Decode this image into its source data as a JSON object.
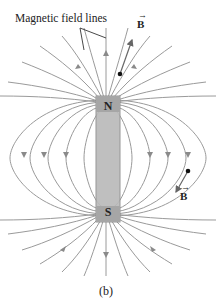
{
  "figure": {
    "label": "Magnetic field lines",
    "north_pole": "N",
    "south_pole": "S",
    "field_vector_top": "B",
    "field_vector_right": "B",
    "caption": "(b)"
  },
  "colors": {
    "field_line": "#9a9a9a",
    "magnet_fill": "#b9b9b9",
    "magnet_stroke": "#8c8c8c",
    "text": "#222222",
    "dot": "#111111"
  }
}
